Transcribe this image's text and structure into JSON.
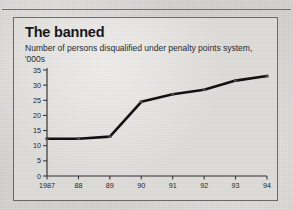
{
  "page": {
    "background_color": "#d6d4d0",
    "panel_color": "#dedcd8",
    "border_color": "#6c6a66"
  },
  "top_strip": {
    "cells": [
      "1991",
      "1992",
      "1993",
      "1994"
    ],
    "note": "partially cropped table header row above chart"
  },
  "chart_data": {
    "type": "line",
    "title": "The banned",
    "subtitle": "Number of persons disqualified under penalty points system, '000s",
    "xlabel": "",
    "ylabel": "",
    "categories": [
      "1987",
      "88",
      "89",
      "90",
      "91",
      "92",
      "93",
      "94"
    ],
    "values": [
      12.3,
      12.3,
      13.0,
      24.5,
      27.0,
      28.5,
      31.5,
      33.0
    ],
    "ylim": [
      0,
      35
    ],
    "yticks": [
      0,
      5,
      10,
      15,
      20,
      25,
      30,
      35
    ],
    "ytick_labels": [
      "0",
      "5",
      "10",
      "15",
      "20",
      "25",
      "30",
      "35"
    ],
    "grid": false,
    "legend": false,
    "series_color": "#111113",
    "marker_color": "#4a4a4c"
  }
}
